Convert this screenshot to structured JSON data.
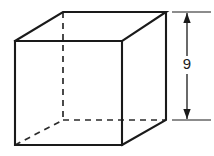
{
  "figure": {
    "shape_name": "cube",
    "projection": "oblique",
    "background_color": "#ffffff",
    "line_color": "#1a1a1a",
    "front_face": {
      "top_left": [
        15,
        41
      ],
      "top_right": [
        122,
        41
      ],
      "bottom_right": [
        122,
        145
      ],
      "bottom_left": [
        15,
        145
      ]
    },
    "back_face": {
      "top_left": [
        63,
        12
      ],
      "top_right": [
        166,
        12
      ],
      "bottom_right": [
        166,
        120
      ],
      "bottom_left": [
        63,
        120
      ]
    },
    "hidden_edges": [
      "back-vertical-left",
      "back-bottom-horizontal",
      "bottom-left-diagonal"
    ],
    "dimension": {
      "label": "9",
      "orientation": "vertical",
      "axis_x": 187,
      "top_y": 12,
      "bottom_y": 120,
      "extension_line_top_y": 12,
      "extension_line_bottom_y": 120,
      "extension_line_x_start": 172,
      "extension_line_x_end": 211,
      "label_x": 187,
      "label_y": 65,
      "arrow_top_direction": "up",
      "arrow_bottom_direction": "down"
    }
  }
}
